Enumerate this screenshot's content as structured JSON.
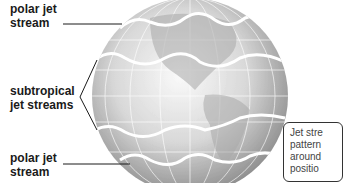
{
  "labels": {
    "polar_top": [
      "polar jet",
      "stream"
    ],
    "subtropical": [
      "subtropical",
      "jet streams"
    ],
    "polar_bottom": [
      "polar jet",
      "stream"
    ]
  },
  "callout": {
    "lines": [
      "Jet stre",
      "pattern",
      "around",
      "positio"
    ]
  },
  "colors": {
    "globe_light": "#f4f4f4",
    "globe_dark": "#9a9a9a",
    "jet_stream": "#ffffff",
    "leader_line": "#1a1a1a"
  }
}
